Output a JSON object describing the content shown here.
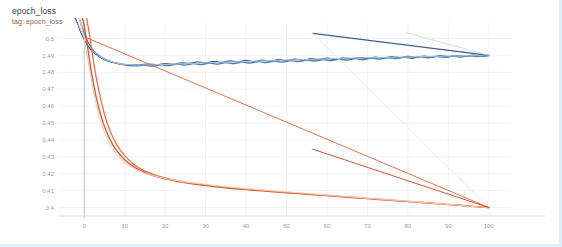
{
  "header": {
    "title": "epoch_loss",
    "subtitle": "tag: epoch_loss"
  },
  "colors": {
    "blue_dark": "#3b5f8a",
    "blue_mid": "#4a7bb0",
    "blue_light": "#a8c4de",
    "orange_dark": "#d4562a",
    "orange_mid": "#e2734a",
    "orange_light": "#f3cbb8",
    "grid": "#e9eef2",
    "axis": "#b9c0c6",
    "tick_text": "#9a9a9a",
    "card_border": "#dff0fb"
  },
  "chart_data": {
    "type": "line",
    "title": "epoch_loss",
    "subtitle": "tag: epoch_loss",
    "xlabel": "",
    "ylabel": "",
    "xlim": [
      -4,
      104
    ],
    "ylim": [
      0.395,
      0.505
    ],
    "grid": true,
    "legend": "none",
    "x_ticks": [
      0,
      10,
      20,
      30,
      40,
      50,
      60,
      70,
      80,
      90,
      100
    ],
    "y_ticks": [
      0.4,
      0.41,
      0.42,
      0.43,
      0.44,
      0.45,
      0.46,
      0.47,
      0.48,
      0.49,
      0.5
    ],
    "series": [
      {
        "name": "validation-loss-a",
        "color": "#3b5f8a",
        "width": 1.3,
        "points": [
          [
            -2.2,
            0.512
          ],
          [
            -1.5,
            0.508
          ],
          [
            -0.8,
            0.5035
          ],
          [
            0,
            0.4995
          ],
          [
            1,
            0.4955
          ],
          [
            2,
            0.4925
          ],
          [
            3,
            0.4905
          ],
          [
            4,
            0.4888
          ],
          [
            5,
            0.4875
          ],
          [
            6,
            0.4866
          ],
          [
            7,
            0.4859
          ],
          [
            8,
            0.4853
          ],
          [
            9,
            0.4849
          ],
          [
            10,
            0.4846
          ],
          [
            12,
            0.4843
          ],
          [
            14,
            0.4845
          ],
          [
            16,
            0.4848
          ],
          [
            18,
            0.4844
          ],
          [
            20,
            0.4851
          ],
          [
            22,
            0.4847
          ],
          [
            24,
            0.4856
          ],
          [
            26,
            0.4852
          ],
          [
            28,
            0.4861
          ],
          [
            30,
            0.4855
          ],
          [
            32,
            0.4864
          ],
          [
            34,
            0.4858
          ],
          [
            36,
            0.4867
          ],
          [
            38,
            0.4861
          ],
          [
            40,
            0.487
          ],
          [
            42,
            0.4863
          ],
          [
            44,
            0.4872
          ],
          [
            46,
            0.4866
          ],
          [
            48,
            0.4875
          ],
          [
            50,
            0.4869
          ],
          [
            52,
            0.4878
          ],
          [
            54,
            0.4871
          ],
          [
            56,
            0.488
          ],
          [
            58,
            0.4874
          ],
          [
            60,
            0.4883
          ],
          [
            62,
            0.4877
          ],
          [
            64,
            0.4885
          ],
          [
            66,
            0.4879
          ],
          [
            68,
            0.4887
          ],
          [
            70,
            0.4882
          ],
          [
            72,
            0.489
          ],
          [
            74,
            0.4884
          ],
          [
            76,
            0.4892
          ],
          [
            78,
            0.4886
          ],
          [
            80,
            0.4894
          ],
          [
            82,
            0.4888
          ],
          [
            84,
            0.4896
          ],
          [
            86,
            0.489
          ],
          [
            88,
            0.4898
          ],
          [
            90,
            0.4892
          ],
          [
            92,
            0.4899
          ],
          [
            94,
            0.4894
          ],
          [
            96,
            0.4901
          ],
          [
            98,
            0.4896
          ],
          [
            100,
            0.49
          ]
        ]
      },
      {
        "name": "validation-loss-b",
        "color": "#4a7bb0",
        "width": 1.3,
        "points": [
          [
            -1.2,
            0.512
          ],
          [
            -0.5,
            0.5065
          ],
          [
            0.3,
            0.5015
          ],
          [
            1.2,
            0.4965
          ],
          [
            2.5,
            0.4922
          ],
          [
            4,
            0.4893
          ],
          [
            5.5,
            0.4873
          ],
          [
            7,
            0.486
          ],
          [
            9,
            0.4848
          ],
          [
            11,
            0.484
          ],
          [
            13,
            0.4838
          ],
          [
            15,
            0.4841
          ],
          [
            17,
            0.4836
          ],
          [
            19,
            0.4844
          ],
          [
            21,
            0.4839
          ],
          [
            23,
            0.4848
          ],
          [
            25,
            0.4842
          ],
          [
            27,
            0.4851
          ],
          [
            29,
            0.4845
          ],
          [
            31,
            0.4854
          ],
          [
            33,
            0.4848
          ],
          [
            35,
            0.4857
          ],
          [
            37,
            0.4851
          ],
          [
            39,
            0.486
          ],
          [
            41,
            0.4854
          ],
          [
            43,
            0.4863
          ],
          [
            45,
            0.4857
          ],
          [
            47,
            0.4866
          ],
          [
            49,
            0.486
          ],
          [
            51,
            0.4869
          ],
          [
            53,
            0.4863
          ],
          [
            55,
            0.4872
          ],
          [
            57,
            0.4866
          ],
          [
            59,
            0.4875
          ],
          [
            61,
            0.4869
          ],
          [
            63,
            0.4878
          ],
          [
            65,
            0.4872
          ],
          [
            67,
            0.4881
          ],
          [
            69,
            0.4875
          ],
          [
            71,
            0.4884
          ],
          [
            73,
            0.4878
          ],
          [
            75,
            0.4886
          ],
          [
            77,
            0.4881
          ],
          [
            79,
            0.4889
          ],
          [
            81,
            0.4883
          ],
          [
            83,
            0.4891
          ],
          [
            85,
            0.4886
          ],
          [
            87,
            0.4893
          ],
          [
            89,
            0.4888
          ],
          [
            91,
            0.4895
          ],
          [
            93,
            0.489
          ],
          [
            95,
            0.4897
          ],
          [
            97,
            0.4893
          ],
          [
            100,
            0.4899
          ]
        ]
      },
      {
        "name": "validation-loss-smoothed-faint",
        "color": "#a8c4de",
        "width": 1.0,
        "points": [
          [
            -2.5,
            0.512
          ],
          [
            -1,
            0.5055
          ],
          [
            0.5,
            0.4985
          ],
          [
            2,
            0.493
          ],
          [
            4,
            0.489
          ],
          [
            6,
            0.4868
          ],
          [
            8,
            0.4855
          ],
          [
            10,
            0.4847
          ],
          [
            14,
            0.4843
          ],
          [
            18,
            0.4845
          ],
          [
            22,
            0.4848
          ],
          [
            26,
            0.4852
          ],
          [
            30,
            0.4856
          ],
          [
            34,
            0.4859
          ],
          [
            38,
            0.4862
          ],
          [
            42,
            0.4866
          ],
          [
            46,
            0.4869
          ],
          [
            50,
            0.4872
          ],
          [
            54,
            0.4875
          ],
          [
            58,
            0.4878
          ],
          [
            62,
            0.4881
          ],
          [
            66,
            0.4884
          ],
          [
            70,
            0.4886
          ],
          [
            74,
            0.4888
          ],
          [
            78,
            0.489
          ],
          [
            82,
            0.4892
          ],
          [
            86,
            0.4894
          ],
          [
            90,
            0.4896
          ],
          [
            94,
            0.4897
          ],
          [
            97,
            0.4898
          ],
          [
            100,
            0.4899
          ]
        ]
      },
      {
        "name": "validation-trend-line-dark",
        "color": "#3b5f8a",
        "width": 1.1,
        "points": [
          [
            56.5,
            0.503
          ],
          [
            100,
            0.49
          ]
        ]
      },
      {
        "name": "validation-trend-line-light",
        "color": "#c6d8e9",
        "width": 0.9,
        "points": [
          [
            79.5,
            0.5035
          ],
          [
            100,
            0.49
          ]
        ]
      },
      {
        "name": "validation-trend-line-faint-down",
        "color": "#dde7f0",
        "width": 0.9,
        "points": [
          [
            56.5,
            0.503
          ],
          [
            100,
            0.4
          ]
        ]
      },
      {
        "name": "train-loss-a",
        "color": "#d4562a",
        "width": 1.3,
        "points": [
          [
            -0.4,
            0.512
          ],
          [
            0.4,
            0.502
          ],
          [
            1.2,
            0.489
          ],
          [
            2,
            0.477
          ],
          [
            3,
            0.465
          ],
          [
            4,
            0.4555
          ],
          [
            5,
            0.448
          ],
          [
            6,
            0.4422
          ],
          [
            7,
            0.4375
          ],
          [
            8,
            0.4338
          ],
          [
            9,
            0.4308
          ],
          [
            10,
            0.4283
          ],
          [
            12,
            0.4245
          ],
          [
            14,
            0.4218
          ],
          [
            16,
            0.4198
          ],
          [
            18,
            0.4182
          ],
          [
            20,
            0.417
          ],
          [
            24,
            0.415
          ],
          [
            28,
            0.4135
          ],
          [
            32,
            0.4124
          ],
          [
            36,
            0.4114
          ],
          [
            40,
            0.4106
          ],
          [
            44,
            0.4098
          ],
          [
            48,
            0.4091
          ],
          [
            52,
            0.4084
          ],
          [
            56,
            0.4077
          ],
          [
            60,
            0.407
          ],
          [
            64,
            0.4063
          ],
          [
            68,
            0.4056
          ],
          [
            72,
            0.4049
          ],
          [
            76,
            0.4042
          ],
          [
            80,
            0.4035
          ],
          [
            84,
            0.4028
          ],
          [
            88,
            0.4021
          ],
          [
            92,
            0.4014
          ],
          [
            96,
            0.4007
          ],
          [
            100,
            0.4
          ]
        ]
      },
      {
        "name": "train-loss-b",
        "color": "#e2734a",
        "width": 1.3,
        "points": [
          [
            0.6,
            0.512
          ],
          [
            1.4,
            0.501
          ],
          [
            2.2,
            0.488
          ],
          [
            3,
            0.4765
          ],
          [
            4,
            0.4648
          ],
          [
            5,
            0.4552
          ],
          [
            6,
            0.4478
          ],
          [
            7,
            0.442
          ],
          [
            8,
            0.4374
          ],
          [
            9,
            0.4337
          ],
          [
            10,
            0.4307
          ],
          [
            12,
            0.426
          ],
          [
            14,
            0.4228
          ],
          [
            16,
            0.4206
          ],
          [
            18,
            0.4189
          ],
          [
            20,
            0.4176
          ],
          [
            24,
            0.4155
          ],
          [
            28,
            0.414
          ],
          [
            32,
            0.4128
          ],
          [
            36,
            0.4118
          ],
          [
            40,
            0.4109
          ],
          [
            44,
            0.4101
          ],
          [
            48,
            0.4093
          ],
          [
            52,
            0.4086
          ],
          [
            56,
            0.4079
          ],
          [
            60,
            0.4072
          ],
          [
            64,
            0.4065
          ],
          [
            68,
            0.4058
          ],
          [
            72,
            0.4051
          ],
          [
            76,
            0.4044
          ],
          [
            80,
            0.4037
          ],
          [
            84,
            0.403
          ],
          [
            88,
            0.4022
          ],
          [
            92,
            0.4015
          ],
          [
            96,
            0.4007
          ],
          [
            100,
            0.4
          ]
        ]
      },
      {
        "name": "train-loss-smoothed-faint",
        "color": "#f3cbb8",
        "width": 1.1,
        "points": [
          [
            -1.2,
            0.512
          ],
          [
            0,
            0.5
          ],
          [
            1,
            0.486
          ],
          [
            2,
            0.472
          ],
          [
            3,
            0.4605
          ],
          [
            4,
            0.4515
          ],
          [
            5,
            0.4445
          ],
          [
            6,
            0.4392
          ],
          [
            7,
            0.435
          ],
          [
            8,
            0.4317
          ],
          [
            9,
            0.429
          ],
          [
            10,
            0.4268
          ],
          [
            12,
            0.4235
          ],
          [
            14,
            0.4212
          ],
          [
            16,
            0.4195
          ],
          [
            18,
            0.4182
          ],
          [
            20,
            0.4172
          ],
          [
            24,
            0.4155
          ],
          [
            28,
            0.4142
          ],
          [
            32,
            0.4131
          ],
          [
            36,
            0.4121
          ],
          [
            40,
            0.4112
          ],
          [
            44,
            0.4104
          ],
          [
            48,
            0.4096
          ],
          [
            52,
            0.4089
          ],
          [
            56,
            0.4082
          ],
          [
            60,
            0.4074
          ],
          [
            64,
            0.4067
          ],
          [
            68,
            0.406
          ],
          [
            72,
            0.4052
          ],
          [
            76,
            0.4045
          ],
          [
            80,
            0.4038
          ],
          [
            84,
            0.403
          ],
          [
            88,
            0.4022
          ],
          [
            92,
            0.4015
          ],
          [
            96,
            0.4007
          ],
          [
            100,
            0.4
          ]
        ]
      },
      {
        "name": "train-trend-line-long",
        "color": "#e2734a",
        "width": 1.0,
        "points": [
          [
            0.5,
            0.5005
          ],
          [
            100,
            0.4
          ]
        ]
      },
      {
        "name": "train-trend-line-short",
        "color": "#d4562a",
        "width": 1.0,
        "points": [
          [
            56.5,
            0.4345
          ],
          [
            100,
            0.4
          ]
        ]
      }
    ]
  }
}
